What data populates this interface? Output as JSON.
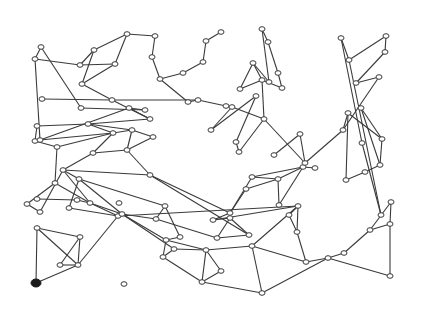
{
  "diagram": {
    "type": "network-graph",
    "background": "#ffffff",
    "edge_color": "#3a3a3a",
    "node_fill": "#ffffff",
    "highlighted_node_fill": "#1a1a1a",
    "highlighted_node": 0,
    "nodes": [
      [
        36,
        283
      ],
      [
        37,
        228
      ],
      [
        69,
        208
      ],
      [
        80,
        237
      ],
      [
        60,
        265
      ],
      [
        78,
        265
      ],
      [
        118,
        216
      ],
      [
        124,
        284
      ],
      [
        27,
        204
      ],
      [
        40,
        212
      ],
      [
        63,
        170
      ],
      [
        79,
        179
      ],
      [
        90,
        203
      ],
      [
        119,
        203
      ],
      [
        122,
        214
      ],
      [
        156,
        219
      ],
      [
        165,
        206
      ],
      [
        166,
        240
      ],
      [
        180,
        237
      ],
      [
        163,
        257
      ],
      [
        174,
        249
      ],
      [
        206,
        250
      ],
      [
        202,
        282
      ],
      [
        221,
        271
      ],
      [
        217,
        238
      ],
      [
        249,
        235
      ],
      [
        230,
        218
      ],
      [
        213,
        220
      ],
      [
        298,
        206
      ],
      [
        289,
        215
      ],
      [
        297,
        232
      ],
      [
        252,
        246
      ],
      [
        306,
        262
      ],
      [
        262,
        293
      ],
      [
        328,
        258
      ],
      [
        344,
        253
      ],
      [
        370,
        230
      ],
      [
        391,
        202
      ],
      [
        390,
        224
      ],
      [
        390,
        276
      ],
      [
        279,
        205
      ],
      [
        278,
        179
      ],
      [
        303,
        167
      ],
      [
        315,
        168
      ],
      [
        252,
        177
      ],
      [
        246,
        189
      ],
      [
        230,
        213
      ],
      [
        150,
        175
      ],
      [
        127,
        150
      ],
      [
        153,
        137
      ],
      [
        132,
        130
      ],
      [
        88,
        124
      ],
      [
        37,
        126
      ],
      [
        35,
        141
      ],
      [
        57,
        147
      ],
      [
        55,
        183
      ],
      [
        113,
        133
      ],
      [
        93,
        153
      ],
      [
        150,
        119
      ],
      [
        129,
        108
      ],
      [
        145,
        110
      ],
      [
        112,
        100
      ],
      [
        42,
        99
      ],
      [
        77,
        200
      ],
      [
        37,
        199
      ],
      [
        40,
        140
      ],
      [
        81,
        108
      ],
      [
        41,
        47
      ],
      [
        35,
        59
      ],
      [
        80,
        65
      ],
      [
        94,
        50
      ],
      [
        82,
        84
      ],
      [
        115,
        64
      ],
      [
        127,
        34
      ],
      [
        155,
        36
      ],
      [
        152,
        57
      ],
      [
        160,
        79
      ],
      [
        183,
        73
      ],
      [
        203,
        62
      ],
      [
        206,
        41
      ],
      [
        221,
        32
      ],
      [
        188,
        102
      ],
      [
        198,
        100
      ],
      [
        226,
        106
      ],
      [
        232,
        107
      ],
      [
        211,
        130
      ],
      [
        256,
        96
      ],
      [
        236,
        142
      ],
      [
        239,
        152
      ],
      [
        264,
        119
      ],
      [
        262,
        80
      ],
      [
        240,
        89
      ],
      [
        253,
        63
      ],
      [
        269,
        82
      ],
      [
        262,
        29
      ],
      [
        268,
        42
      ],
      [
        278,
        73
      ],
      [
        282,
        88
      ],
      [
        300,
        134
      ],
      [
        305,
        163
      ],
      [
        343,
        130
      ],
      [
        348,
        113
      ],
      [
        346,
        180
      ],
      [
        365,
        172
      ],
      [
        380,
        165
      ],
      [
        382,
        139
      ],
      [
        381,
        215
      ],
      [
        362,
        143
      ],
      [
        341,
        38
      ],
      [
        349,
        60
      ],
      [
        386,
        36
      ],
      [
        385,
        52
      ],
      [
        356,
        83
      ],
      [
        379,
        77
      ],
      [
        361,
        108
      ],
      [
        274,
        155
      ]
    ],
    "edges": [
      [
        0,
        1
      ],
      [
        0,
        5
      ],
      [
        1,
        3
      ],
      [
        1,
        5
      ],
      [
        3,
        4
      ],
      [
        3,
        5
      ],
      [
        4,
        5
      ],
      [
        5,
        6
      ],
      [
        6,
        12
      ],
      [
        6,
        28
      ],
      [
        2,
        6
      ],
      [
        2,
        11
      ],
      [
        11,
        16
      ],
      [
        10,
        11
      ],
      [
        10,
        12
      ],
      [
        12,
        14
      ],
      [
        14,
        15
      ],
      [
        15,
        16
      ],
      [
        16,
        18
      ],
      [
        17,
        18
      ],
      [
        17,
        19
      ],
      [
        14,
        17
      ],
      [
        14,
        20
      ],
      [
        19,
        20
      ],
      [
        20,
        21
      ],
      [
        17,
        21
      ],
      [
        21,
        22
      ],
      [
        22,
        23
      ],
      [
        21,
        23
      ],
      [
        21,
        31
      ],
      [
        19,
        22
      ],
      [
        22,
        33
      ],
      [
        31,
        33
      ],
      [
        31,
        32
      ],
      [
        28,
        31
      ],
      [
        29,
        30
      ],
      [
        28,
        29
      ],
      [
        28,
        30
      ],
      [
        30,
        32
      ],
      [
        32,
        34
      ],
      [
        33,
        34
      ],
      [
        34,
        35
      ],
      [
        35,
        36
      ],
      [
        36,
        37
      ],
      [
        37,
        38
      ],
      [
        36,
        38
      ],
      [
        38,
        39
      ],
      [
        34,
        39
      ],
      [
        40,
        42
      ],
      [
        40,
        41
      ],
      [
        41,
        42
      ],
      [
        42,
        43
      ],
      [
        42,
        44
      ],
      [
        41,
        44
      ],
      [
        41,
        45
      ],
      [
        44,
        46
      ],
      [
        45,
        46
      ],
      [
        46,
        47
      ],
      [
        46,
        27
      ],
      [
        27,
        28
      ],
      [
        26,
        27
      ],
      [
        24,
        26
      ],
      [
        15,
        24
      ],
      [
        24,
        25
      ],
      [
        25,
        26
      ],
      [
        25,
        47
      ],
      [
        47,
        48
      ],
      [
        48,
        49
      ],
      [
        49,
        50
      ],
      [
        48,
        50
      ],
      [
        50,
        51
      ],
      [
        51,
        52
      ],
      [
        52,
        53
      ],
      [
        53,
        54
      ],
      [
        54,
        55
      ],
      [
        55,
        8
      ],
      [
        8,
        9
      ],
      [
        9,
        10
      ],
      [
        55,
        12
      ],
      [
        12,
        63
      ],
      [
        63,
        64
      ],
      [
        10,
        57
      ],
      [
        57,
        48
      ],
      [
        56,
        57
      ],
      [
        56,
        51
      ],
      [
        56,
        50
      ],
      [
        54,
        56
      ],
      [
        51,
        58
      ],
      [
        58,
        59
      ],
      [
        59,
        60
      ],
      [
        58,
        61
      ],
      [
        61,
        62
      ],
      [
        53,
        65
      ],
      [
        65,
        56
      ],
      [
        10,
        47
      ],
      [
        11,
        14
      ],
      [
        60,
        66
      ],
      [
        66,
        67
      ],
      [
        67,
        68
      ],
      [
        68,
        69
      ],
      [
        69,
        70
      ],
      [
        70,
        71
      ],
      [
        71,
        72
      ],
      [
        69,
        72
      ],
      [
        72,
        73
      ],
      [
        73,
        74
      ],
      [
        74,
        75
      ],
      [
        75,
        76
      ],
      [
        76,
        77
      ],
      [
        77,
        78
      ],
      [
        78,
        79
      ],
      [
        79,
        80
      ],
      [
        73,
        70
      ],
      [
        76,
        81
      ],
      [
        81,
        82
      ],
      [
        82,
        83
      ],
      [
        83,
        84
      ],
      [
        84,
        85
      ],
      [
        85,
        86
      ],
      [
        86,
        87
      ],
      [
        87,
        88
      ],
      [
        88,
        89
      ],
      [
        89,
        90
      ],
      [
        90,
        91
      ],
      [
        91,
        92
      ],
      [
        92,
        93
      ],
      [
        93,
        94
      ],
      [
        94,
        95
      ],
      [
        95,
        96
      ],
      [
        96,
        97
      ],
      [
        97,
        90
      ],
      [
        84,
        89
      ],
      [
        90,
        92
      ],
      [
        98,
        99
      ],
      [
        99,
        89
      ],
      [
        99,
        100
      ],
      [
        100,
        101
      ],
      [
        101,
        102
      ],
      [
        102,
        103
      ],
      [
        103,
        104
      ],
      [
        104,
        105
      ],
      [
        105,
        101
      ],
      [
        106,
        107
      ],
      [
        107,
        108
      ],
      [
        108,
        109
      ],
      [
        109,
        106
      ],
      [
        109,
        110
      ],
      [
        110,
        111
      ],
      [
        111,
        112
      ],
      [
        112,
        113
      ],
      [
        113,
        100
      ],
      [
        114,
        105
      ],
      [
        114,
        104
      ],
      [
        115,
        98
      ],
      [
        68,
        65
      ],
      [
        82,
        61
      ],
      [
        71,
        61
      ],
      [
        65,
        59
      ]
    ]
  }
}
